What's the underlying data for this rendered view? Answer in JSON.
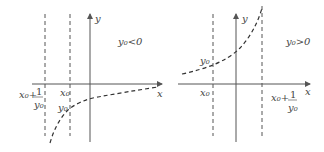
{
  "panels": [
    {
      "id": "left",
      "condition": "y₀<0",
      "axis_x_label": "x",
      "axis_y_label": "y",
      "asymptote_label_main": "x₀+",
      "asymptote_label_frac_num": "1",
      "asymptote_label_frac_den": "y₀",
      "x0_label": "x₀",
      "y0_label": "y₀"
    },
    {
      "id": "right",
      "condition": "y₀>0",
      "axis_x_label": "x",
      "axis_y_label": "y",
      "asymptote_label_main": "x₀+",
      "asymptote_label_frac_num": "1",
      "asymptote_label_frac_den": "y₀",
      "x0_label": "x₀",
      "y0_label": "y₀"
    }
  ]
}
